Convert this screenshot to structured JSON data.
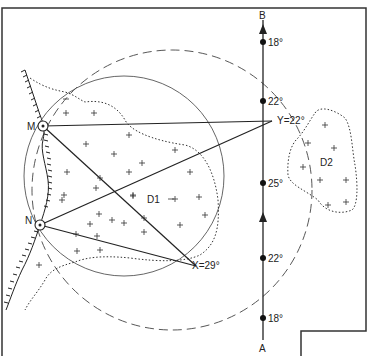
{
  "diagram": {
    "axis": {
      "start_label": "A",
      "end_label": "B",
      "points": [
        {
          "label": "18°",
          "y": 318
        },
        {
          "label": "22°",
          "y": 258
        },
        {
          "label": "25°",
          "y": 183
        },
        {
          "label": "22°",
          "y": 101
        },
        {
          "label": "18°",
          "y": 42
        }
      ]
    },
    "stations": {
      "m_label": "M",
      "n_label": "N"
    },
    "targets": {
      "x_label": "X=29°",
      "y_label": "Y=22°"
    },
    "regions": {
      "d1_label": "D1",
      "d2_label": "D2"
    },
    "colors": {
      "line": "#222222",
      "frame": "#333333"
    }
  }
}
